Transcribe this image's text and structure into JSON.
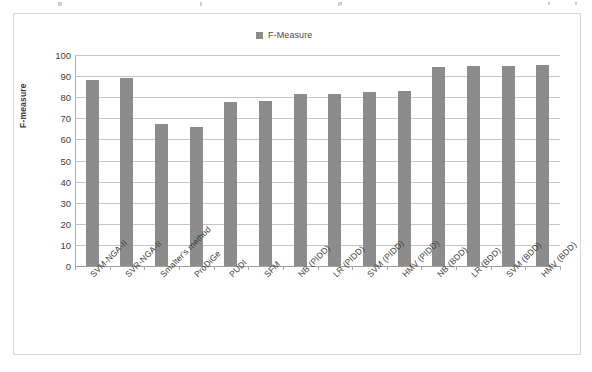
{
  "chart_data": {
    "type": "bar",
    "title": "",
    "xlabel": "",
    "ylabel": "F-measure",
    "ylim": [
      0,
      100
    ],
    "ytick_step": 10,
    "yticks": [
      0,
      10,
      20,
      30,
      40,
      50,
      60,
      70,
      80,
      90,
      100
    ],
    "grid": true,
    "legend_position": "top-center",
    "legend": [
      "F-Measure"
    ],
    "series_name": "F-Measure",
    "bar_color": "#8c8c8c",
    "categories": [
      "SVM-NGA-II",
      "SVR-NGA-II",
      "Smalter's method",
      "ProDiGe",
      "PUDI",
      "SFM",
      "NB (PIDD)",
      "LR (PIDD)",
      "SVM (PIDD)",
      "HMV (PIDD)",
      "NB (BDD)",
      "LR (BDD)",
      "SVM (BDD)",
      "HMV (BDD)"
    ],
    "values": [
      88.0,
      89.3,
      67.5,
      65.8,
      77.8,
      78.3,
      81.3,
      81.6,
      82.3,
      82.8,
      94.2,
      94.6,
      94.6,
      95.3
    ]
  },
  "legend": {
    "label": "F-Measure",
    "swatch_color": "#8c8c8c"
  },
  "axis": {
    "y_title": "F-measure"
  }
}
